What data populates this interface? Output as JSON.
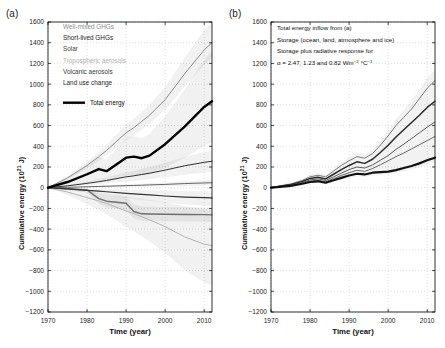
{
  "figure": {
    "panel_a_tag": "(a)",
    "panel_b_tag": "(b)",
    "axis_x_title": "Time (year)",
    "axis_y_title": "Cumulative energy (10",
    "axis_y_title_exp": "21",
    "axis_y_title_tail": " J)"
  },
  "legend_a": {
    "items": [
      {
        "label": "Well-mixed GHGs",
        "color": "#8c8c8c"
      },
      {
        "label": "Short-lived GHGs",
        "color": "#1a1a1a"
      },
      {
        "label": "Solar",
        "color": "#444444"
      },
      {
        "label": "Tropospheric aerosols",
        "color": "#b0b0b0"
      },
      {
        "label": "Volcanic aerosols",
        "color": "#3a3a3a"
      },
      {
        "label": "Land use change",
        "color": "#2a2a2a"
      },
      {
        "label": "Total energy",
        "color": "#000000",
        "swatch": "thick-line"
      }
    ]
  },
  "legend_b": {
    "lines": [
      "Total energy inflow from (a)",
      "Storage (ocean, land, atmosphere and ice)",
      "Storage plus radiative response for"
    ],
    "alpha_prefix": "α = 2.47, 1.23 and 0.82 Wm",
    "alpha_exp1": "−2",
    "alpha_mid": " °C",
    "alpha_exp2": "−1"
  },
  "chart_data": [
    {
      "type": "line",
      "panel": "(a)",
      "title": "",
      "xlabel": "Time (year)",
      "ylabel": "Cumulative energy (10^21 J)",
      "xlim": [
        1970,
        2012
      ],
      "ylim": [
        -1200,
        1600
      ],
      "xticks": [
        1970,
        1980,
        1990,
        2000,
        2010
      ],
      "yticks": [
        -1200,
        -1000,
        -800,
        -600,
        -400,
        -200,
        0,
        200,
        400,
        600,
        800,
        1000,
        1200,
        1400,
        1600
      ],
      "grid": true,
      "legend_position": "upper-left-inside",
      "x": [
        1970,
        1975,
        1980,
        1983,
        1985,
        1990,
        1992,
        1994,
        1996,
        2000,
        2005,
        2010,
        2012
      ],
      "series": [
        {
          "name": "Well-mixed GHGs",
          "color": "#8c8c8c",
          "width": 1.0,
          "values": [
            0,
            95,
            215,
            300,
            360,
            530,
            580,
            640,
            700,
            850,
            1100,
            1330,
            1400
          ],
          "band_low": [
            0,
            80,
            185,
            260,
            310,
            460,
            505,
            560,
            615,
            750,
            975,
            1185,
            1250
          ],
          "band_high": [
            0,
            112,
            250,
            345,
            415,
            610,
            665,
            735,
            800,
            975,
            1255,
            1520,
            1600
          ]
        },
        {
          "name": "Short-lived GHGs",
          "color": "#1a1a1a",
          "width": 0.9,
          "values": [
            0,
            18,
            42,
            58,
            70,
            105,
            115,
            128,
            140,
            170,
            212,
            245,
            255
          ],
          "band_low": [
            0,
            10,
            24,
            33,
            40,
            60,
            66,
            74,
            81,
            99,
            124,
            145,
            152
          ],
          "band_high": [
            0,
            26,
            60,
            83,
            100,
            150,
            164,
            182,
            199,
            241,
            300,
            345,
            358
          ]
        },
        {
          "name": "Solar",
          "color": "#555555",
          "width": 0.9,
          "values": [
            0,
            4,
            9,
            12,
            14,
            20,
            22,
            24,
            27,
            32,
            40,
            46,
            48
          ],
          "band_low": [
            0,
            1,
            3,
            4,
            5,
            8,
            9,
            10,
            11,
            13,
            17,
            20,
            21
          ],
          "band_high": [
            0,
            7,
            15,
            20,
            24,
            33,
            36,
            39,
            43,
            51,
            64,
            73,
            76
          ]
        },
        {
          "name": "Tropospheric aerosols",
          "color": "#b4b4b4",
          "width": 1.0,
          "values": [
            0,
            -42,
            -95,
            -128,
            -152,
            -225,
            -250,
            -280,
            -310,
            -375,
            -475,
            -545,
            -560
          ],
          "band_low": [
            0,
            -70,
            -160,
            -215,
            -255,
            -380,
            -420,
            -470,
            -520,
            -630,
            -800,
            -915,
            -945
          ],
          "band_high": [
            0,
            -16,
            -36,
            -48,
            -58,
            -85,
            -94,
            -105,
            -117,
            -141,
            -179,
            -205,
            -212
          ]
        },
        {
          "name": "Volcanic aerosols",
          "color": "#6e6e6e",
          "width": 1.4,
          "values": [
            0,
            -10,
            -22,
            -105,
            -130,
            -150,
            -230,
            -252,
            -254,
            -256,
            -258,
            -260,
            -262
          ],
          "band_low": [
            0,
            -22,
            -46,
            -155,
            -190,
            -215,
            -300,
            -320,
            -322,
            -324,
            -326,
            -328,
            -330
          ],
          "band_high": [
            0,
            -2,
            -6,
            -60,
            -76,
            -90,
            -160,
            -182,
            -184,
            -186,
            -188,
            -190,
            -192
          ]
        },
        {
          "name": "Land use change",
          "color": "#333333",
          "width": 1.2,
          "values": [
            0,
            -12,
            -25,
            -33,
            -39,
            -55,
            -60,
            -65,
            -70,
            -80,
            -90,
            -96,
            -98
          ],
          "band_low": [
            0,
            -22,
            -45,
            -60,
            -71,
            -100,
            -109,
            -118,
            -127,
            -145,
            -163,
            -174,
            -178
          ],
          "band_high": [
            0,
            -4,
            -8,
            -11,
            -13,
            -18,
            -20,
            -22,
            -24,
            -27,
            -31,
            -33,
            -34
          ]
        },
        {
          "name": "Total energy",
          "color": "#000000",
          "width": 2.4,
          "values": [
            0,
            55,
            130,
            180,
            160,
            290,
            300,
            285,
            310,
            420,
            590,
            780,
            835
          ],
          "band_low": [
            0,
            20,
            50,
            70,
            55,
            120,
            125,
            115,
            130,
            190,
            290,
            400,
            440
          ],
          "band_high": [
            0,
            90,
            215,
            300,
            275,
            480,
            500,
            480,
            520,
            690,
            950,
            1230,
            1320
          ]
        }
      ]
    },
    {
      "type": "line",
      "panel": "(b)",
      "title": "",
      "xlabel": "Time (year)",
      "ylabel": "Cumulative energy (10^21 J)",
      "xlim": [
        1970,
        2012
      ],
      "ylim": [
        -1200,
        1600
      ],
      "xticks": [
        1970,
        1980,
        1990,
        2000,
        2010
      ],
      "yticks": [
        -1200,
        -1000,
        -800,
        -600,
        -400,
        -200,
        0,
        200,
        400,
        600,
        800,
        1000,
        1200,
        1400,
        1600
      ],
      "grid": true,
      "legend_position": "upper-left-inside",
      "x": [
        1970,
        1975,
        1978,
        1980,
        1982,
        1984,
        1986,
        1988,
        1990,
        1992,
        1994,
        1996,
        1998,
        2000,
        2002,
        2004,
        2006,
        2008,
        2010,
        2012
      ],
      "series": [
        {
          "name": "Storage plus radiative response (alpha = 2.47)",
          "color": "#7a7a7a",
          "width": 1.0,
          "values": [
            0,
            35,
            70,
            105,
            120,
            105,
            160,
            215,
            260,
            300,
            285,
            330,
            410,
            500,
            600,
            680,
            760,
            860,
            960,
            1035
          ]
        },
        {
          "name": "Total energy inflow from (a)",
          "color": "#2a2a2a",
          "width": 1.5,
          "values": [
            0,
            30,
            60,
            90,
            100,
            85,
            130,
            175,
            215,
            250,
            235,
            275,
            340,
            410,
            490,
            560,
            630,
            700,
            775,
            835
          ]
        },
        {
          "name": "Storage plus radiative response (alpha = 1.23)",
          "color": "#5a5a5a",
          "width": 1.0,
          "values": [
            0,
            25,
            50,
            75,
            85,
            70,
            105,
            140,
            175,
            200,
            190,
            220,
            265,
            310,
            370,
            420,
            475,
            530,
            585,
            635
          ]
        },
        {
          "name": "Storage plus radiative response (alpha = 0.82)",
          "color": "#6a6a6a",
          "width": 1.0,
          "values": [
            0,
            20,
            42,
            62,
            72,
            58,
            88,
            118,
            145,
            168,
            158,
            185,
            222,
            260,
            300,
            335,
            375,
            415,
            455,
            495
          ]
        },
        {
          "name": "Storage (ocean, land, atmosphere and ice)",
          "color": "#111111",
          "width": 2.2,
          "values": [
            0,
            18,
            38,
            55,
            62,
            48,
            72,
            95,
            118,
            135,
            128,
            145,
            150,
            155,
            170,
            190,
            210,
            235,
            265,
            290
          ]
        }
      ]
    }
  ]
}
